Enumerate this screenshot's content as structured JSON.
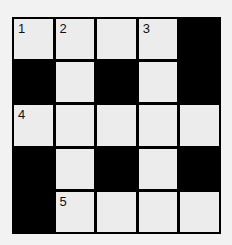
{
  "puzzle": {
    "rows": 5,
    "cols": 5,
    "cells": [
      [
        {
          "type": "white",
          "number": "1"
        },
        {
          "type": "white",
          "number": "2"
        },
        {
          "type": "white",
          "number": ""
        },
        {
          "type": "white",
          "number": "3"
        },
        {
          "type": "black",
          "number": ""
        }
      ],
      [
        {
          "type": "black",
          "number": ""
        },
        {
          "type": "white",
          "number": ""
        },
        {
          "type": "black",
          "number": ""
        },
        {
          "type": "white",
          "number": ""
        },
        {
          "type": "black",
          "number": ""
        }
      ],
      [
        {
          "type": "white",
          "number": "4"
        },
        {
          "type": "white",
          "number": ""
        },
        {
          "type": "white",
          "number": ""
        },
        {
          "type": "white",
          "number": ""
        },
        {
          "type": "white",
          "number": ""
        }
      ],
      [
        {
          "type": "black",
          "number": ""
        },
        {
          "type": "white",
          "number": ""
        },
        {
          "type": "black",
          "number": ""
        },
        {
          "type": "white",
          "number": ""
        },
        {
          "type": "black",
          "number": ""
        }
      ],
      [
        {
          "type": "black",
          "number": ""
        },
        {
          "type": "white",
          "number": "5"
        },
        {
          "type": "white",
          "number": ""
        },
        {
          "type": "white",
          "number": ""
        },
        {
          "type": "white",
          "number": ""
        }
      ]
    ]
  },
  "colors": {
    "white_cell": "#ececec",
    "black_cell": "#000000",
    "background": "#f2f2f2"
  }
}
